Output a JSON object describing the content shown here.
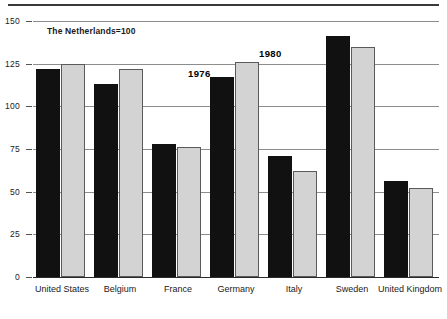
{
  "chart_data": {
    "type": "bar",
    "title": "",
    "subtitle": "The Netherlands=100",
    "xlabel": "",
    "ylabel": "",
    "ylim": [
      0,
      150
    ],
    "yticks": [
      0,
      25,
      50,
      75,
      100,
      125,
      150
    ],
    "grid": true,
    "legend_position": "inline-annotations",
    "categories": [
      "United States",
      "Belgium",
      "France",
      "Germany",
      "Italy",
      "Sweden",
      "United Kingdom"
    ],
    "series": [
      {
        "name": "1976",
        "color": "#111111",
        "values": [
          122,
          113,
          78,
          117,
          71,
          141,
          56
        ]
      },
      {
        "name": "1980",
        "color": "#d3d3d3",
        "values": [
          125,
          122,
          76,
          126,
          62,
          135,
          52
        ]
      }
    ],
    "annotations": [
      {
        "text": "1976",
        "refers_to_series": "1976"
      },
      {
        "text": "1980",
        "refers_to_series": "1980"
      }
    ]
  },
  "axis": {
    "tick_labels": [
      "150",
      "125",
      "100",
      "75",
      "50",
      "25",
      "0"
    ]
  }
}
